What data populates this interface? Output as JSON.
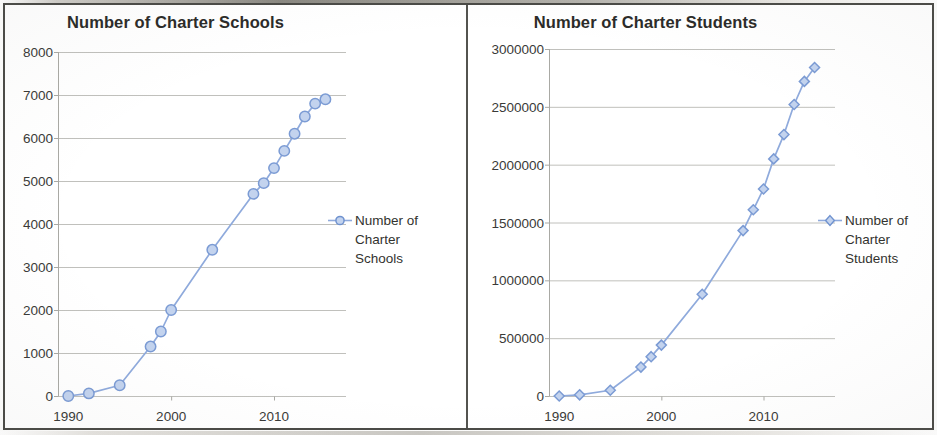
{
  "figure": {
    "panel_count": 2,
    "frame_color": "#4a4a46",
    "series_color": "#8faadc",
    "text_color": "#33332f"
  },
  "chart_data": [
    {
      "type": "line",
      "title": "Number of Charter Schools",
      "xlabel": "",
      "ylabel": "",
      "legend": [
        "Number of Charter Schools"
      ],
      "legend_position": "right",
      "legend_marker": "circle",
      "grid": true,
      "xlim": [
        1989,
        2017
      ],
      "ylim": [
        0,
        8000
      ],
      "xticks": [
        1990,
        2000,
        2010
      ],
      "xticklabels": [
        "1990",
        "2000",
        "2010"
      ],
      "yticks": [
        0,
        1000,
        2000,
        3000,
        4000,
        5000,
        6000,
        7000,
        8000
      ],
      "yticklabels": [
        "0",
        "1000",
        "2000",
        "3000",
        "4000",
        "5000",
        "6000",
        "7000",
        "8000"
      ],
      "x": [
        1990,
        1992,
        1995,
        1998,
        1999,
        2000,
        2004,
        2008,
        2009,
        2010,
        2011,
        2012,
        2013,
        2014,
        2015
      ],
      "values": [
        0,
        60,
        250,
        1150,
        1500,
        2000,
        3400,
        4700,
        4950,
        5300,
        5700,
        6100,
        6500,
        6800,
        6900
      ],
      "series": [
        {
          "name": "Number of Charter Schools",
          "values": [
            0,
            60,
            250,
            1150,
            1500,
            2000,
            3400,
            4700,
            4950,
            5300,
            5700,
            6100,
            6500,
            6800,
            6900
          ]
        }
      ]
    },
    {
      "type": "line",
      "title": "Number of Charter Students",
      "xlabel": "",
      "ylabel": "",
      "legend": [
        "Number of Charter Students"
      ],
      "legend_position": "right",
      "legend_marker": "diamond",
      "grid": true,
      "xlim": [
        1989,
        2017
      ],
      "ylim": [
        0,
        3000000
      ],
      "xticks": [
        1990,
        2000,
        2010
      ],
      "xticklabels": [
        "1990",
        "2000",
        "2010"
      ],
      "yticks": [
        0,
        500000,
        1000000,
        1500000,
        2000000,
        2500000,
        3000000
      ],
      "yticklabels": [
        "0",
        "500000",
        "1000000",
        "1500000",
        "2000000",
        "2500000",
        "3000000"
      ],
      "x": [
        1990,
        1992,
        1995,
        1998,
        1999,
        2000,
        2004,
        2008,
        2009,
        2010,
        2011,
        2012,
        2013,
        2014,
        2015
      ],
      "values": [
        0,
        10000,
        50000,
        250000,
        340000,
        440000,
        880000,
        1430000,
        1610000,
        1790000,
        2050000,
        2260000,
        2520000,
        2720000,
        2840000
      ],
      "series": [
        {
          "name": "Number of Charter Students",
          "values": [
            0,
            10000,
            50000,
            250000,
            340000,
            440000,
            880000,
            1430000,
            1610000,
            1790000,
            2050000,
            2260000,
            2520000,
            2720000,
            2840000
          ]
        }
      ]
    }
  ],
  "panels": [
    {
      "title": "Number of Charter Schools",
      "legend_label_lines": [
        "Number of",
        "Charter",
        "Schools"
      ]
    },
    {
      "title": "Number of Charter Students",
      "legend_label_lines": [
        "Number of",
        "Charter",
        "Students"
      ]
    }
  ]
}
